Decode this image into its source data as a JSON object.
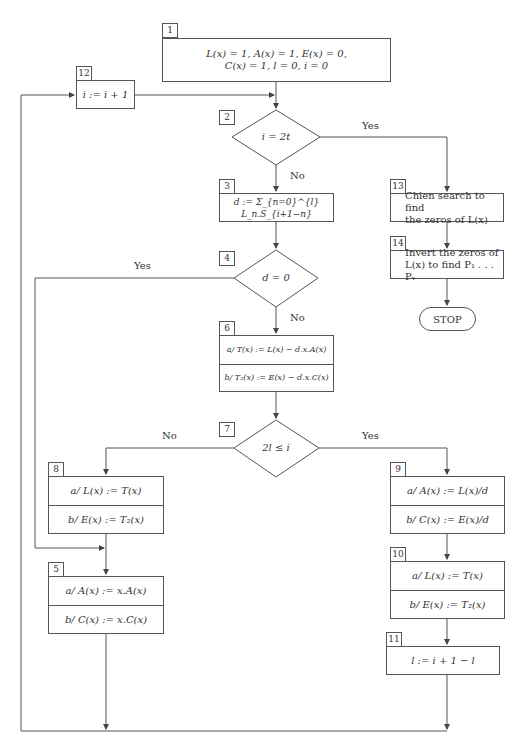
{
  "diagram": {
    "type": "flowchart",
    "nodes": {
      "n1": {
        "tag": "1",
        "lines": [
          "L(x) = 1,  A(x) = 1,  E(x) = 0,",
          "C(x) = 1,  l = 0,  i = 0"
        ]
      },
      "n2": {
        "tag": "2",
        "condition": "i = 2t"
      },
      "n3": {
        "tag": "3",
        "text": "d := Σ_{n=0}^{l} L_n.S_{i+1−n}"
      },
      "n4": {
        "tag": "4",
        "condition": "d = 0"
      },
      "n5": {
        "tag": "5",
        "a": "a/ A(x) := x.A(x)",
        "b": "b/ C(x) := x.C(x)"
      },
      "n6": {
        "tag": "6",
        "a": "a/ T(x) := L(x) − d.x.A(x)",
        "b": "b/ T₂(x) := E(x) − d.x.C(x)"
      },
      "n7": {
        "tag": "7",
        "condition": "2l ≤ i"
      },
      "n8": {
        "tag": "8",
        "a": "a/ L(x) := T(x)",
        "b": "b/ E(x) := T₂(x)"
      },
      "n9": {
        "tag": "9",
        "a": "a/ A(x) := L(x)/d",
        "b": "b/ C(x) := E(x)/d"
      },
      "n10": {
        "tag": "10",
        "a": "a/ L(x) := T(x)",
        "b": "b/ E(x) := T₂(x)"
      },
      "n11": {
        "tag": "11",
        "text": "l := i + 1 − l"
      },
      "n12": {
        "tag": "12",
        "text": "i := i + 1"
      },
      "n13": {
        "tag": "13",
        "lines": [
          "Chien search to find",
          "the zeros of L(x)"
        ]
      },
      "n14": {
        "tag": "14",
        "lines": [
          "Invert the zeros of",
          "L(x) to find P₁ . . . Pᵥ"
        ]
      },
      "stop": {
        "text": "STOP"
      }
    },
    "edge_labels": {
      "n2_yes": "Yes",
      "n2_no": "No",
      "n4_yes": "Yes",
      "n4_no": "No",
      "n7_no": "No",
      "n7_yes": "Yes"
    },
    "edges": [
      {
        "from": "1",
        "to": "2"
      },
      {
        "from": "12",
        "to": "2"
      },
      {
        "from": "2",
        "to": "3",
        "label": "No"
      },
      {
        "from": "2",
        "to": "13",
        "label": "Yes"
      },
      {
        "from": "13",
        "to": "14"
      },
      {
        "from": "14",
        "to": "STOP"
      },
      {
        "from": "3",
        "to": "4"
      },
      {
        "from": "4",
        "to": "6",
        "label": "No"
      },
      {
        "from": "4",
        "to": "5",
        "label": "Yes"
      },
      {
        "from": "6",
        "to": "7"
      },
      {
        "from": "7",
        "to": "8",
        "label": "No"
      },
      {
        "from": "7",
        "to": "9",
        "label": "Yes"
      },
      {
        "from": "8",
        "to": "5"
      },
      {
        "from": "9",
        "to": "10"
      },
      {
        "from": "10",
        "to": "11"
      },
      {
        "from": "5",
        "to": "12"
      },
      {
        "from": "11",
        "to": "12"
      }
    ]
  }
}
